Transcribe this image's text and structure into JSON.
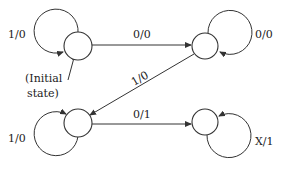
{
  "diagram": {
    "type": "finite-state-machine",
    "states": [
      {
        "id": "A",
        "label": "",
        "initial": true,
        "cx": 78,
        "cy": 46
      },
      {
        "id": "B",
        "label": "",
        "cx": 205,
        "cy": 46
      },
      {
        "id": "C",
        "label": "",
        "cx": 78,
        "cy": 123
      },
      {
        "id": "D",
        "label": "",
        "cx": 205,
        "cy": 122
      }
    ],
    "transitions": [
      {
        "from": "A",
        "to": "A",
        "label": "1/0"
      },
      {
        "from": "A",
        "to": "B",
        "label": "0/0"
      },
      {
        "from": "B",
        "to": "B",
        "label": "0/0"
      },
      {
        "from": "B",
        "to": "C",
        "label": "1/0"
      },
      {
        "from": "C",
        "to": "C",
        "label": "1/0"
      },
      {
        "from": "C",
        "to": "D",
        "label": "0/1"
      },
      {
        "from": "D",
        "to": "D",
        "label": "X/1"
      }
    ],
    "initial_note_line1": "(Initial",
    "initial_note_line2": "state)"
  }
}
